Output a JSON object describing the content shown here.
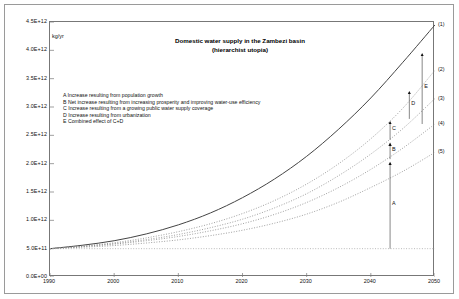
{
  "figure": {
    "unit_label": "kg/yr",
    "title_lines": [
      "Domestic water supply in the Zambezi basin",
      "(hierarchist utopia)"
    ]
  },
  "legend": {
    "rows": [
      "A Increase resulting from population growth",
      "B Net increase resulting from increasing prosperity and improving water-use efficiency",
      "C Increase resulting from a growing public water supply coverage",
      "D Increase resulting from urbanization",
      "E Combined effect of C+D"
    ]
  },
  "curve_labels": [
    {
      "text": "(1)",
      "y_value": 4450000000000
    },
    {
      "text": "(2)",
      "y_value": 3650000000000
    },
    {
      "text": "(3)",
      "y_value": 3150000000000
    },
    {
      "text": "(4)",
      "y_value": 2700000000000
    },
    {
      "text": "(5)",
      "y_value": 2200000000000
    }
  ],
  "arrow_labels": [
    {
      "text": "A",
      "x_value": 2043.0,
      "y_from": 500000000000,
      "y_to": 2080000000000
    },
    {
      "text": "B",
      "x_value": 2043.0,
      "y_from": 2080000000000,
      "y_to": 2420000000000
    },
    {
      "text": "C",
      "x_value": 2043.0,
      "y_from": 2420000000000,
      "y_to": 2800000000000
    },
    {
      "text": "D",
      "x_value": 2046.0,
      "y_from": 2790000000000,
      "y_to": 3330000000000
    },
    {
      "text": "E",
      "x_value": 2048.0,
      "y_from": 2700000000000,
      "y_to": 4000000000000
    }
  ],
  "chart_data": {
    "type": "line",
    "title": "Domestic water supply in the Zambezi basin (hierarchist utopia)",
    "xlabel": "",
    "ylabel": "kg/yr",
    "xlim": [
      1990,
      2050
    ],
    "ylim": [
      0,
      4500000000000
    ],
    "grid": false,
    "legend_position": "none",
    "x_ticks": [
      1990,
      2000,
      2010,
      2020,
      2030,
      2040,
      2050
    ],
    "y_ticks": [
      0,
      500000000000,
      1000000000000,
      1500000000000,
      2000000000000,
      2500000000000,
      3000000000000,
      3500000000000,
      4000000000000,
      4500000000000
    ],
    "y_tick_labels": [
      "0.0E+00",
      "5.0E+11",
      "1.0E+12",
      "1.5E+12",
      "2.0E+12",
      "2.5E+12",
      "3.0E+12",
      "3.5E+12",
      "4.0E+12",
      "4.5E+12"
    ],
    "x": [
      1990,
      1995,
      2000,
      2005,
      2010,
      2015,
      2020,
      2025,
      2030,
      2035,
      2040,
      2045,
      2050
    ],
    "series": [
      {
        "name": "(1)",
        "label": "(1)",
        "style": "solid",
        "color": "#444444",
        "values": [
          500000000000,
          560000000000,
          640000000000,
          760000000000,
          920000000000,
          1130000000000,
          1400000000000,
          1730000000000,
          2130000000000,
          2610000000000,
          3160000000000,
          3790000000000,
          4450000000000
        ]
      },
      {
        "name": "(2)",
        "label": "(2)",
        "style": "dotted",
        "color": "#888888",
        "values": [
          500000000000,
          545000000000,
          605000000000,
          690000000000,
          800000000000,
          940000000000,
          1120000000000,
          1350000000000,
          1640000000000,
          2000000000000,
          2440000000000,
          2980000000000,
          3650000000000
        ]
      },
      {
        "name": "(3)",
        "label": "(3)",
        "style": "dotted",
        "color": "#888888",
        "values": [
          500000000000,
          540000000000,
          590000000000,
          660000000000,
          750000000000,
          870000000000,
          1020000000000,
          1220000000000,
          1470000000000,
          1790000000000,
          2170000000000,
          2620000000000,
          3150000000000
        ]
      },
      {
        "name": "(4)",
        "label": "(4)",
        "style": "dotted",
        "color": "#888888",
        "values": [
          500000000000,
          535000000000,
          580000000000,
          640000000000,
          715000000000,
          815000000000,
          940000000000,
          1105000000000,
          1315000000000,
          1580000000000,
          1900000000000,
          2275000000000,
          2700000000000
        ]
      },
      {
        "name": "(5)",
        "label": "(5)",
        "style": "dotted",
        "color": "#888888",
        "values": [
          500000000000,
          525000000000,
          555000000000,
          600000000000,
          655000000000,
          730000000000,
          825000000000,
          950000000000,
          1110000000000,
          1320000000000,
          1580000000000,
          1865000000000,
          2200000000000
        ]
      },
      {
        "name": "baseline",
        "label": "",
        "style": "dotted",
        "color": "#aaaaaa",
        "values": [
          500000000000,
          500000000000,
          500000000000,
          500000000000,
          500000000000,
          500000000000,
          500000000000,
          500000000000,
          500000000000,
          500000000000,
          500000000000,
          500000000000,
          500000000000
        ]
      }
    ]
  }
}
